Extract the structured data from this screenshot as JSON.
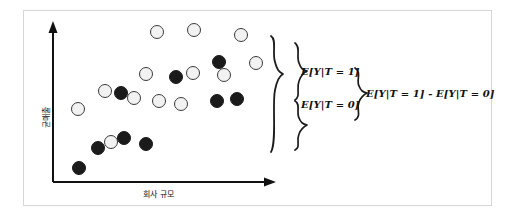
{
  "figure": {
    "type": "scatter",
    "x_axis_label": "회사 규모",
    "y_axis_label": "균매출",
    "annotations": {
      "treated_mean": "E[Y|T = 1]",
      "control_mean": "E[Y|T = 0]",
      "difference": "E[Y|T = 1] - E[Y|T = 0]"
    },
    "icons": {
      "y_axis_arrow": "arrow-up-icon",
      "x_axis_arrow": "arrow-right-icon",
      "brace_outer": "curly-brace-icon",
      "brace_treated": "curly-brace-icon",
      "brace_control": "curly-brace-icon",
      "brace_difference": "curly-brace-icon"
    },
    "colors": {
      "light_point_fill": "#f2f2f2",
      "light_point_stroke": "#3a3a3a",
      "dark_point_fill": "#1b1b1b",
      "axis": "#111111",
      "frame_border": "#d6d6d6",
      "background": "#ffffff"
    }
  },
  "chart_data": {
    "type": "scatter",
    "title": "",
    "xlabel": "회사 규모",
    "ylabel": "균매출",
    "xlim": [
      0,
      100
    ],
    "ylim": [
      0,
      100
    ],
    "grid": false,
    "legend": "none",
    "series": [
      {
        "name": "E[Y|T = 0]",
        "marker": "light-circle",
        "points": [
          [
            6,
            38
          ],
          [
            16,
            56
          ],
          [
            26,
            48
          ],
          [
            37,
            62
          ],
          [
            47,
            88
          ],
          [
            52,
            72
          ],
          [
            57,
            46
          ],
          [
            62,
            56
          ],
          [
            68,
            45
          ],
          [
            77,
            96
          ],
          [
            84,
            80
          ],
          [
            92,
            66
          ],
          [
            21,
            21
          ]
        ]
      },
      {
        "name": "E[Y|T = 1]",
        "marker": "dark-circle",
        "points": [
          [
            5,
            6
          ],
          [
            13,
            17
          ],
          [
            18,
            24
          ],
          [
            28,
            19
          ],
          [
            23,
            50
          ],
          [
            43,
            58
          ],
          [
            56,
            42
          ],
          [
            69,
            42
          ],
          [
            72,
            68
          ],
          [
            80,
            75
          ]
        ]
      }
    ],
    "annotations": [
      {
        "text": "E[Y|T = 1]",
        "kind": "group-mean-label"
      },
      {
        "text": "E[Y|T = 0]",
        "kind": "group-mean-label"
      },
      {
        "text": "E[Y|T = 1] - E[Y|T = 0]",
        "kind": "difference-label"
      }
    ]
  },
  "points": {
    "light": [
      {
        "cx": 78,
        "cy": 109,
        "r": 7
      },
      {
        "cx": 157,
        "cy": 32,
        "r": 7
      },
      {
        "cx": 194,
        "cy": 30,
        "r": 7
      },
      {
        "cx": 241,
        "cy": 35,
        "r": 7
      },
      {
        "cx": 146,
        "cy": 74,
        "r": 7
      },
      {
        "cx": 105,
        "cy": 91,
        "r": 7
      },
      {
        "cx": 193,
        "cy": 73,
        "r": 7
      },
      {
        "cx": 256,
        "cy": 63,
        "r": 7
      },
      {
        "cx": 134,
        "cy": 98,
        "r": 7
      },
      {
        "cx": 159,
        "cy": 101,
        "r": 7
      },
      {
        "cx": 181,
        "cy": 104,
        "r": 7
      },
      {
        "cx": 111,
        "cy": 142,
        "r": 7
      },
      {
        "cx": 224,
        "cy": 75,
        "r": 7
      }
    ],
    "dark": [
      {
        "cx": 79,
        "cy": 168,
        "r": 7
      },
      {
        "cx": 98,
        "cy": 148,
        "r": 7
      },
      {
        "cx": 124,
        "cy": 138,
        "r": 7
      },
      {
        "cx": 146,
        "cy": 144,
        "r": 7
      },
      {
        "cx": 121,
        "cy": 93,
        "r": 7
      },
      {
        "cx": 176,
        "cy": 77,
        "r": 7
      },
      {
        "cx": 217,
        "cy": 101,
        "r": 7
      },
      {
        "cx": 237,
        "cy": 99,
        "r": 7
      },
      {
        "cx": 219,
        "cy": 62,
        "r": 7
      }
    ]
  },
  "axes": {
    "y": {
      "x": 53,
      "top": 23,
      "bottom": 182
    },
    "x": {
      "y": 182,
      "left": 53,
      "right": 275
    }
  }
}
